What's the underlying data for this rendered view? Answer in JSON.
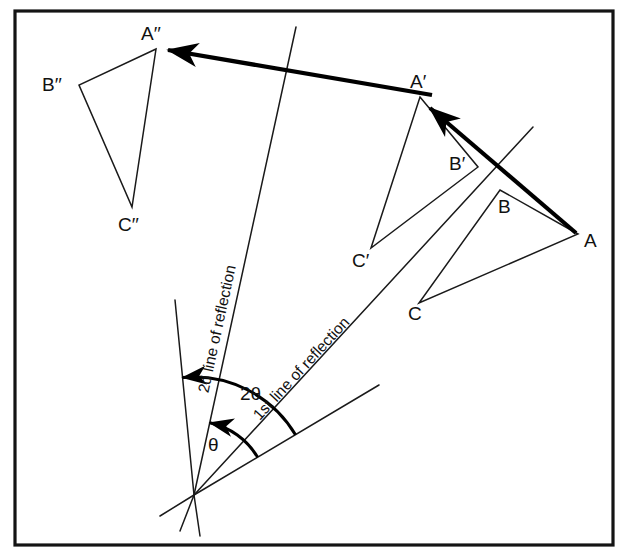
{
  "figure": {
    "frame": {
      "x": 15,
      "y": 11,
      "width": 598,
      "height": 534,
      "stroke": "#141414"
    },
    "canvas": {
      "width": 625,
      "height": 557,
      "background": "#ffffff"
    },
    "ink_color": "#1a1a1a"
  },
  "triangles": [
    {
      "name": "original-triangle",
      "id": "ABC",
      "vertices": [
        {
          "label": "A",
          "x": 578,
          "y": 234,
          "label_x": 584,
          "label_y": 247
        },
        {
          "label": "B",
          "x": 500,
          "y": 190,
          "label_x": 498,
          "label_y": 213
        },
        {
          "label": "C",
          "x": 419,
          "y": 303,
          "label_x": 408,
          "label_y": 320
        }
      ]
    },
    {
      "name": "first-image-triangle",
      "id": "A'B'C'",
      "vertices": [
        {
          "label": "A′",
          "x": 420,
          "y": 97,
          "label_x": 410,
          "label_y": 88
        },
        {
          "label": "B′",
          "x": 478,
          "y": 167,
          "label_x": 449,
          "label_y": 170
        },
        {
          "label": "C′",
          "x": 371,
          "y": 248,
          "label_x": 352,
          "label_y": 267
        }
      ]
    },
    {
      "name": "second-image-triangle",
      "id": "A''B''C''",
      "vertices": [
        {
          "label": "A′′",
          "x": 156,
          "y": 49,
          "label_x": 141,
          "label_y": 40
        },
        {
          "label": "B′′",
          "x": 79,
          "y": 85,
          "label_x": 42,
          "label_y": 91
        },
        {
          "label": "C′′",
          "x": 132,
          "y": 207,
          "label_x": 118,
          "label_y": 231
        }
      ]
    }
  ],
  "reflection_lines": [
    {
      "name": "first-line-of-reflection",
      "label": "1st line of reflection",
      "x1": 194,
      "y1": 495,
      "x2": 533,
      "y2": 127,
      "label_x": 305,
      "label_y": 372,
      "label_rotation": -47.3
    },
    {
      "name": "second-line-of-reflection",
      "label": "2d line of reflection",
      "x1": 194,
      "y1": 495,
      "x2": 296,
      "y2": 27,
      "label_x": 222,
      "label_y": 330,
      "label_rotation": -77.7
    }
  ],
  "construction_lines": [
    {
      "name": "steep-left-ray",
      "x1": 194,
      "y1": 495,
      "x2": 175,
      "y2": 300
    },
    {
      "name": "steep-left-ray-extension",
      "x1": 194,
      "y1": 495,
      "x2": 200,
      "y2": 536
    },
    {
      "name": "second-line-extension",
      "x1": 194,
      "y1": 495,
      "x2": 180,
      "y2": 531
    },
    {
      "name": "lower-right-ray",
      "x1": 194,
      "y1": 495,
      "x2": 379,
      "y2": 385
    },
    {
      "name": "lower-right-ray-extension",
      "x1": 194,
      "y1": 495,
      "x2": 160,
      "y2": 516
    }
  ],
  "mapping_arrows": [
    {
      "name": "arrow-A-to-A-prime",
      "x1": 576,
      "y1": 233,
      "x2": 427,
      "y2": 105,
      "label": "A to A′"
    },
    {
      "name": "arrow-A-prime-to-A-double-prime",
      "x1": 432,
      "y1": 95,
      "x2": 163,
      "y2": 49,
      "label": "A′ to A′′"
    }
  ],
  "angles": [
    {
      "name": "theta-angle",
      "label": "θ",
      "label_x": 208,
      "label_y": 451,
      "vertex_x": 194,
      "vertex_y": 495,
      "radius": 74,
      "start_deg": -30.7,
      "end_deg": -77.7,
      "description": "angle between 1st line of reflection and 2d line of reflection"
    },
    {
      "name": "two-theta-angle",
      "label": "2θ",
      "label_x": 240,
      "label_y": 400,
      "vertex_x": 194,
      "vertex_y": 495,
      "radius": 118,
      "start_deg": -30.7,
      "end_deg": -95.6,
      "description": "total rotation angle, twice theta"
    }
  ],
  "vertex_point": {
    "name": "intersection-point",
    "x": 194,
    "y": 495
  }
}
